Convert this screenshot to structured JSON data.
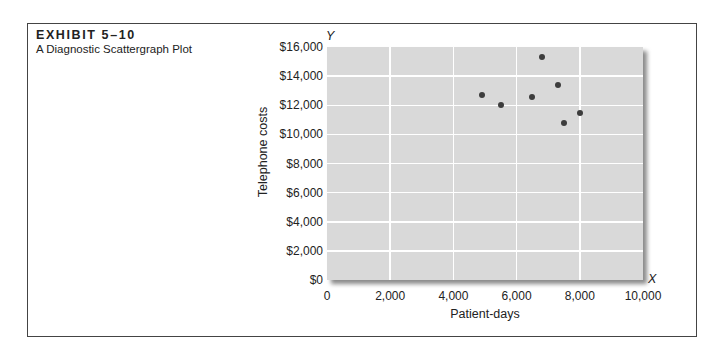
{
  "exhibit": {
    "label": "EXHIBIT 5–10",
    "title": "A Diagnostic Scattergraph Plot"
  },
  "axes": {
    "y_letter": "Y",
    "x_letter": "X",
    "ylabel": "Telephone costs",
    "xlabel": "Patient-days",
    "yticks": [
      "$0",
      "$2,000",
      "$4,000",
      "$6,000",
      "$8,000",
      "$10,000",
      "$12,000",
      "$14,000",
      "$16,000"
    ],
    "xticks": [
      "0",
      "2,000",
      "4,000",
      "6,000",
      "8,000",
      "10,000"
    ]
  },
  "colors": {
    "plot_background": "#d9d9d9",
    "gridlines": "#ffffff",
    "points": "#3d3d3d",
    "frame": "#444444"
  },
  "chart_data": {
    "type": "scatter",
    "title": "A Diagnostic Scattergraph Plot",
    "subtitle": "EXHIBIT 5–10",
    "xlabel": "Patient-days",
    "ylabel": "Telephone costs",
    "xlim": [
      0,
      10000
    ],
    "ylim": [
      0,
      16000
    ],
    "x_ticks": [
      0,
      2000,
      4000,
      6000,
      8000,
      10000
    ],
    "y_ticks": [
      0,
      2000,
      4000,
      6000,
      8000,
      10000,
      12000,
      14000,
      16000
    ],
    "grid": true,
    "legend": null,
    "series": [
      {
        "name": "Observations",
        "points": [
          {
            "x": 4900,
            "y": 12700
          },
          {
            "x": 5500,
            "y": 12000
          },
          {
            "x": 6500,
            "y": 12600
          },
          {
            "x": 6800,
            "y": 15300
          },
          {
            "x": 7300,
            "y": 13400
          },
          {
            "x": 7500,
            "y": 10800
          },
          {
            "x": 8000,
            "y": 11500
          }
        ]
      }
    ]
  }
}
